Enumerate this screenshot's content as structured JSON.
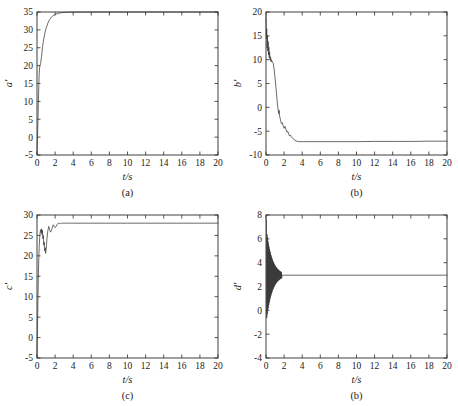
{
  "figure": {
    "background_color": "#ffffff",
    "axis_color": "#2b2b2b",
    "curve_color": "#3a3a3a",
    "layout": "2x2 grid of time-response line plots"
  },
  "chart_data": [
    {
      "type": "line",
      "panel_id": "a",
      "caption": "(a)",
      "title": "",
      "xlabel": "t/s",
      "ylabel": "a'",
      "xlim": [
        0,
        20
      ],
      "ylim": [
        -5,
        35
      ],
      "xticks": [
        0,
        2,
        4,
        6,
        8,
        10,
        12,
        14,
        16,
        18,
        20
      ],
      "xtick_labels": [
        "0",
        "2",
        "4",
        "6",
        "8",
        "10",
        "12",
        "14",
        "16",
        "18",
        "20"
      ],
      "yticks": [
        -5,
        0,
        5,
        10,
        15,
        20,
        25,
        30,
        35
      ],
      "ytick_labels": [
        "-5",
        "0",
        "5",
        "10",
        "15",
        "20",
        "25",
        "30",
        "35"
      ],
      "grid": false,
      "legend": null,
      "series": [
        {
          "name": "a'",
          "x": [
            0,
            0.05,
            0.1,
            0.15,
            0.2,
            0.25,
            0.3,
            0.35,
            0.4,
            0.5,
            0.6,
            0.7,
            0.8,
            0.9,
            1.0,
            1.2,
            1.4,
            1.6,
            1.8,
            2.0,
            2.2,
            2.4,
            2.6,
            2.8,
            3.0,
            3.5,
            4.0,
            5.0,
            6.0,
            8.0,
            10.0,
            12.0,
            14.0,
            16.0,
            18.0,
            20.0
          ],
          "y": [
            -4.6,
            -1.0,
            4.0,
            9.5,
            14.5,
            18.0,
            19.8,
            20.2,
            20.6,
            22.5,
            25.0,
            26.8,
            28.2,
            29.4,
            30.4,
            31.9,
            32.9,
            33.6,
            34.0,
            34.3,
            34.5,
            34.65,
            34.75,
            34.82,
            34.87,
            34.93,
            34.96,
            34.98,
            34.99,
            35.0,
            35.0,
            35.0,
            35.0,
            35.0,
            35.0,
            35.0
          ]
        }
      ]
    },
    {
      "type": "line",
      "panel_id": "b",
      "caption": "(b)",
      "title": "",
      "xlabel": "t/s",
      "ylabel": "b'",
      "xlim": [
        0,
        20
      ],
      "ylim": [
        -10,
        20
      ],
      "xticks": [
        0,
        2,
        4,
        6,
        8,
        10,
        12,
        14,
        16,
        18,
        20
      ],
      "xtick_labels": [
        "0",
        "2",
        "4",
        "6",
        "8",
        "10",
        "12",
        "14",
        "16",
        "18",
        "20"
      ],
      "yticks": [
        -10,
        -5,
        0,
        5,
        10,
        15,
        20
      ],
      "ytick_labels": [
        "-10",
        "-5",
        "0",
        "5",
        "10",
        "15",
        "20"
      ],
      "grid": false,
      "legend": null,
      "series": [
        {
          "name": "b'",
          "x": [
            0,
            0.04,
            0.08,
            0.12,
            0.16,
            0.2,
            0.24,
            0.28,
            0.32,
            0.36,
            0.4,
            0.45,
            0.5,
            0.55,
            0.6,
            0.65,
            0.7,
            0.8,
            0.9,
            1.0,
            1.1,
            1.2,
            1.3,
            1.4,
            1.45,
            1.5,
            1.6,
            1.7,
            1.8,
            1.9,
            2.0,
            2.1,
            2.2,
            2.3,
            2.4,
            2.5,
            2.6,
            2.7,
            2.8,
            3.0,
            3.2,
            3.4,
            3.6,
            4.0,
            5.0,
            6.0,
            8.0,
            10.0,
            12.0,
            14.0,
            16.0,
            18.0,
            20.0
          ],
          "y": [
            19.0,
            14.5,
            16.5,
            12.5,
            15.0,
            11.8,
            13.8,
            11.0,
            12.6,
            10.4,
            11.6,
            9.9,
            10.6,
            9.6,
            10.0,
            9.5,
            9.6,
            9.2,
            8.0,
            6.2,
            4.2,
            2.0,
            0.0,
            -1.3,
            -0.6,
            -1.8,
            -2.6,
            -3.4,
            -3.2,
            -3.9,
            -4.4,
            -4.0,
            -4.6,
            -5.2,
            -5.0,
            -5.6,
            -6.0,
            -5.8,
            -6.2,
            -6.6,
            -6.9,
            -7.1,
            -7.2,
            -7.2,
            -7.2,
            -7.2,
            -7.2,
            -7.2,
            -7.15,
            -7.15,
            -7.15,
            -7.1,
            -7.1
          ]
        }
      ]
    },
    {
      "type": "line",
      "panel_id": "c",
      "caption": "(c)",
      "title": "",
      "xlabel": "t/s",
      "ylabel": "c'",
      "xlim": [
        0,
        20
      ],
      "ylim": [
        -5,
        30
      ],
      "xticks": [
        0,
        2,
        4,
        6,
        8,
        10,
        12,
        14,
        16,
        18,
        20
      ],
      "xtick_labels": [
        "0",
        "2",
        "4",
        "6",
        "8",
        "10",
        "12",
        "14",
        "16",
        "18",
        "20"
      ],
      "yticks": [
        -5,
        0,
        5,
        10,
        15,
        20,
        25,
        30
      ],
      "ytick_labels": [
        "-5",
        "0",
        "5",
        "10",
        "15",
        "20",
        "25",
        "30"
      ],
      "grid": false,
      "legend": null,
      "series": [
        {
          "name": "c'",
          "x": [
            0,
            0.05,
            0.1,
            0.15,
            0.2,
            0.25,
            0.3,
            0.35,
            0.4,
            0.45,
            0.5,
            0.55,
            0.6,
            0.65,
            0.7,
            0.75,
            0.8,
            0.85,
            0.9,
            0.95,
            1.0,
            1.05,
            1.1,
            1.2,
            1.3,
            1.4,
            1.5,
            1.6,
            1.7,
            1.8,
            1.9,
            2.0,
            2.1,
            2.2,
            2.3,
            2.4,
            2.5,
            2.6,
            2.7,
            2.8,
            3.0,
            3.2,
            3.4,
            3.6,
            4.0,
            5.0,
            6.0,
            8.0,
            10.0,
            12.0,
            14.0,
            16.0,
            18.0,
            20.0
          ],
          "y": [
            -4.8,
            2.0,
            9.0,
            15.0,
            19.5,
            22.5,
            24.6,
            25.8,
            26.4,
            25.6,
            26.6,
            25.2,
            26.3,
            24.2,
            25.0,
            22.6,
            23.4,
            21.2,
            22.0,
            20.6,
            21.4,
            22.6,
            24.2,
            26.2,
            27.2,
            26.4,
            25.8,
            26.2,
            27.0,
            27.6,
            27.2,
            26.9,
            27.2,
            27.6,
            27.9,
            28.0,
            27.9,
            27.9,
            28.0,
            28.0,
            28.0,
            28.0,
            28.0,
            28.0,
            28.0,
            28.0,
            28.0,
            28.0,
            28.0,
            28.0,
            28.0,
            28.0,
            28.0,
            28.0
          ]
        }
      ]
    },
    {
      "type": "line",
      "panel_id": "d",
      "caption": "(b)",
      "title": "",
      "xlabel": "t/s",
      "ylabel": "d'",
      "xlim": [
        0,
        20
      ],
      "ylim": [
        -4,
        8
      ],
      "xticks": [
        0,
        2,
        4,
        6,
        8,
        10,
        12,
        14,
        16,
        18,
        20
      ],
      "xtick_labels": [
        "0",
        "2",
        "4",
        "6",
        "8",
        "10",
        "12",
        "14",
        "16",
        "18",
        "20"
      ],
      "yticks": [
        -4,
        -2,
        0,
        2,
        4,
        6,
        8
      ],
      "ytick_labels": [
        "-4",
        "-2",
        "0",
        "2",
        "4",
        "6",
        "8"
      ],
      "grid": false,
      "legend": null,
      "note": "dense high-frequency decaying oscillation, settles near 2.95",
      "series": [
        {
          "name": "d'",
          "oscillation": {
            "start": 0.0,
            "end": 1.75,
            "period": 0.055,
            "center": 2.95,
            "amplitude_start": 4.1,
            "decay_tau": 0.62
          },
          "steady_value": 2.95,
          "initial_value": 7.6
        }
      ]
    }
  ]
}
